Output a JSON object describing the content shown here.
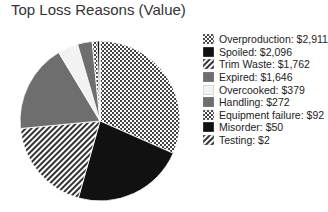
{
  "chart_data": {
    "type": "pie",
    "title": "Top Loss Reasons (Value)",
    "legend_position": "right",
    "slices": [
      {
        "label": "Overproduction",
        "value": 2911,
        "display": "$2,911",
        "pattern": "checker"
      },
      {
        "label": "Spoiled",
        "value": 2096,
        "display": "$2,096",
        "pattern": "black"
      },
      {
        "label": "Trim Waste",
        "value": 1762,
        "display": "$1,762",
        "pattern": "diagonal"
      },
      {
        "label": "Expired",
        "value": 1646,
        "display": "$1,646",
        "pattern": "gray"
      },
      {
        "label": "Overcooked",
        "value": 379,
        "display": "$379",
        "pattern": "light"
      },
      {
        "label": "Handling",
        "value": 272,
        "display": "$272",
        "pattern": "gray"
      },
      {
        "label": "Equipment failure",
        "value": 92,
        "display": "$92",
        "pattern": "checker"
      },
      {
        "label": "Misorder",
        "value": 50,
        "display": "$50",
        "pattern": "black"
      },
      {
        "label": "Testing",
        "value": 2,
        "display": "$2",
        "pattern": "diagonal"
      }
    ]
  },
  "legend": [
    "Overproduction: $2,911",
    "Spoiled: $2,096",
    "Trim Waste: $1,762",
    "Expired: $1,646",
    "Overcooked: $379",
    "Handling: $272",
    "Equipment failure: $92",
    "Misorder: $50",
    "Testing: $2"
  ]
}
